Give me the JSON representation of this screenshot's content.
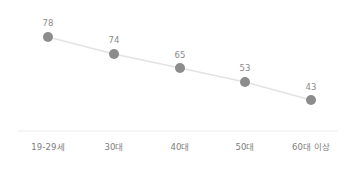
{
  "chart_data": {
    "type": "line",
    "title": "",
    "subtitle": "",
    "xlabel": "",
    "ylabel": "",
    "categories": [
      "19-29세",
      "30대",
      "40대",
      "50대",
      "60대 이상"
    ],
    "values": [
      78,
      74,
      65,
      53,
      43
    ],
    "value_labels": [
      "78",
      "74",
      "65",
      "53",
      "43"
    ],
    "series": [
      {
        "name": "",
        "values": [
          78,
          74,
          65,
          53,
          43
        ]
      }
    ],
    "ylim": [
      0,
      100
    ],
    "grid": false,
    "legend": "none",
    "show_value_labels": true,
    "axis_line": true,
    "colors": {
      "marker": "#8c8c8c",
      "line": "#e3e3e3",
      "value_label": "#8a8a8a",
      "category_label": "#7d7d7d",
      "axis": "#ededed",
      "background": "#ffffff"
    },
    "points": [
      {
        "x": 48,
        "y": 37,
        "label_x": 48,
        "label_y": 19,
        "cat_x": 48
      },
      {
        "x": 114,
        "y": 54,
        "label_x": 114,
        "label_y": 36,
        "cat_x": 114
      },
      {
        "x": 180,
        "y": 68,
        "label_x": 180,
        "label_y": 51,
        "cat_x": 180
      },
      {
        "x": 245,
        "y": 82,
        "label_x": 245,
        "label_y": 64,
        "cat_x": 245
      },
      {
        "x": 311,
        "y": 100,
        "label_x": 311,
        "label_y": 83,
        "cat_x": 311
      }
    ],
    "axis_y": 131,
    "category_label_y": 143
  }
}
